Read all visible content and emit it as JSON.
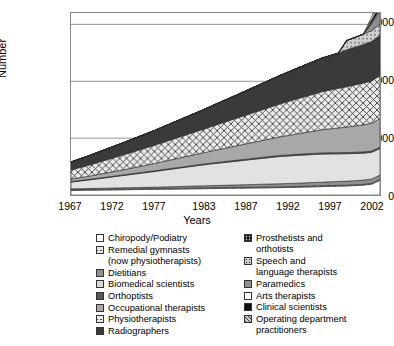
{
  "chart_data": {
    "type": "area",
    "title": "",
    "xlabel": "Years",
    "ylabel": "Number",
    "stacked": true,
    "grid": true,
    "legend_position": "bottom",
    "xlim": [
      1967,
      2004
    ],
    "ylim": [
      0,
      160000
    ],
    "yticks": [
      0,
      50000,
      100000,
      150000
    ],
    "ytick_labels": [
      "0",
      "50 000",
      "100 000",
      "150 000"
    ],
    "xticks": [
      1967,
      1972,
      1977,
      1983,
      1987,
      1992,
      1997,
      2002
    ],
    "xtick_labels": [
      "1967",
      "1972",
      "1977",
      "1983",
      "1987",
      "1992",
      "1997",
      "2002"
    ],
    "x": [
      1967,
      1968,
      1969,
      1970,
      1971,
      1972,
      1973,
      1974,
      1975,
      1976,
      1977,
      1978,
      1979,
      1980,
      1981,
      1982,
      1983,
      1984,
      1985,
      1986,
      1987,
      1988,
      1989,
      1990,
      1991,
      1992,
      1993,
      1994,
      1995,
      1996,
      1997,
      1998,
      1999,
      2000,
      2001,
      2002,
      2003,
      2004
    ],
    "series": [
      {
        "name": "Chiropody/Podiatry",
        "pattern": "white",
        "color": "#ffffff",
        "values": [
          4000,
          4100,
          4200,
          4300,
          4400,
          4500,
          4600,
          4700,
          4800,
          4900,
          5000,
          5100,
          5200,
          5300,
          5400,
          5500,
          5600,
          5700,
          5800,
          5900,
          6000,
          6100,
          6200,
          6300,
          6400,
          6500,
          6600,
          6800,
          7000,
          7200,
          7400,
          7600,
          7800,
          8000,
          8300,
          8700,
          9500,
          13000
        ]
      },
      {
        "name": "Remedial gymnasts\n(now physiotherapists)",
        "pattern": "cross-hatch",
        "color": "#e9e9e9",
        "values": [
          700,
          700,
          700,
          700,
          700,
          700,
          700,
          700,
          700,
          700,
          700,
          700,
          700,
          700,
          700,
          700,
          700,
          700,
          700,
          700,
          700,
          700,
          700,
          700,
          700,
          700,
          700,
          700,
          700,
          700,
          700,
          700,
          700,
          700,
          700,
          700,
          700,
          700
        ]
      },
      {
        "name": "Dietitians",
        "pattern": "mid-gray",
        "color": "#8f8f8f",
        "values": [
          700,
          750,
          800,
          850,
          900,
          950,
          1000,
          1050,
          1100,
          1150,
          1200,
          1300,
          1400,
          1500,
          1600,
          1700,
          1800,
          1900,
          2000,
          2100,
          2200,
          2300,
          2400,
          2500,
          2600,
          2700,
          2800,
          2900,
          3000,
          3100,
          3200,
          3300,
          3400,
          3500,
          3600,
          3700,
          3800,
          3900
        ]
      },
      {
        "name": "Biomedical scientists",
        "pattern": "light-gray",
        "color": "#e2e2e2",
        "values": [
          6000,
          6700,
          7400,
          8200,
          9000,
          9800,
          10600,
          11400,
          12200,
          13000,
          13800,
          14600,
          15400,
          16200,
          17000,
          17800,
          18500,
          19200,
          19800,
          20400,
          21000,
          21600,
          22200,
          22800,
          23400,
          24000,
          24200,
          24400,
          24500,
          24600,
          24700,
          24500,
          24300,
          24100,
          23900,
          23700,
          23500,
          23300
        ]
      },
      {
        "name": "Orthoptists",
        "pattern": "dark-gray",
        "color": "#5a5a5a",
        "values": [
          400,
          420,
          440,
          460,
          480,
          500,
          520,
          540,
          560,
          580,
          600,
          620,
          640,
          660,
          680,
          700,
          720,
          740,
          760,
          780,
          800,
          820,
          840,
          860,
          880,
          900,
          920,
          940,
          960,
          980,
          1000,
          1020,
          1040,
          1060,
          1080,
          1100,
          1120,
          1140
        ]
      },
      {
        "name": "Occupational therapists",
        "pattern": "gray",
        "color": "#a8a8a8",
        "values": [
          2200,
          2500,
          2800,
          3200,
          3600,
          4000,
          4400,
          4900,
          5400,
          5900,
          6400,
          7000,
          7600,
          8200,
          8800,
          9400,
          10000,
          10700,
          11400,
          12100,
          12800,
          13500,
          14200,
          14900,
          15600,
          16300,
          17100,
          17900,
          18700,
          19500,
          20300,
          21000,
          21700,
          22400,
          23100,
          23800,
          24500,
          25200
        ]
      },
      {
        "name": "Physiotherapists",
        "pattern": "cross-hatch",
        "color": "#e9e9e9",
        "values": [
          8000,
          8800,
          9600,
          10400,
          11200,
          12000,
          12800,
          13600,
          14400,
          15200,
          16000,
          16800,
          17600,
          18400,
          19200,
          20000,
          20800,
          21700,
          22600,
          23500,
          24400,
          25300,
          26200,
          27100,
          28000,
          28900,
          29800,
          30700,
          31600,
          32500,
          33400,
          34100,
          34800,
          35500,
          36100,
          36700,
          37200,
          37700
        ]
      },
      {
        "name": "Radiographers",
        "pattern": "very-dark",
        "color": "#3a3a3a",
        "values": [
          7000,
          7600,
          8200,
          8800,
          9400,
          10000,
          10600,
          11200,
          11800,
          12400,
          13000,
          13700,
          14400,
          15100,
          15800,
          16500,
          17300,
          18100,
          18900,
          19700,
          20500,
          21400,
          22300,
          23200,
          24100,
          25000,
          25900,
          26800,
          27700,
          28600,
          29500,
          30200,
          30900,
          31600,
          32300,
          33000,
          33700,
          34400
        ]
      },
      {
        "name": "Prosthetists and\northotists",
        "pattern": "dot-dark",
        "color": "#2e2e2e",
        "values": [
          0,
          0,
          0,
          0,
          0,
          0,
          0,
          0,
          0,
          0,
          0,
          0,
          0,
          0,
          0,
          0,
          0,
          0,
          0,
          0,
          0,
          0,
          0,
          0,
          0,
          0,
          0,
          0,
          0,
          0,
          0,
          0,
          0,
          900,
          950,
          1000,
          1050,
          1100
        ]
      },
      {
        "name": "Speech and\nlanguage therapists",
        "pattern": "dot-light",
        "color": "#cfcfcf",
        "values": [
          0,
          0,
          0,
          0,
          0,
          0,
          0,
          0,
          0,
          0,
          0,
          0,
          0,
          0,
          0,
          0,
          0,
          0,
          0,
          0,
          0,
          0,
          0,
          0,
          0,
          0,
          0,
          0,
          0,
          0,
          0,
          0,
          0,
          8000,
          8500,
          9000,
          9400,
          9800
        ]
      },
      {
        "name": "Paramedics",
        "pattern": "mid-gray",
        "color": "#7d7d7d",
        "values": [
          0,
          0,
          0,
          0,
          0,
          0,
          0,
          0,
          0,
          0,
          0,
          0,
          0,
          0,
          0,
          0,
          0,
          0,
          0,
          0,
          0,
          0,
          0,
          0,
          0,
          0,
          0,
          0,
          0,
          0,
          0,
          0,
          0,
          0,
          0,
          0,
          6000,
          11500
        ]
      },
      {
        "name": "Arts therapists",
        "pattern": "white",
        "color": "#ffffff",
        "values": [
          0,
          0,
          0,
          0,
          0,
          0,
          0,
          0,
          0,
          0,
          0,
          0,
          0,
          0,
          0,
          0,
          0,
          0,
          0,
          0,
          0,
          0,
          0,
          0,
          0,
          0,
          0,
          0,
          0,
          0,
          0,
          0,
          0,
          0,
          0,
          0,
          1200,
          1600
        ]
      },
      {
        "name": "Clinical scientists",
        "pattern": "black",
        "color": "#111111",
        "values": [
          0,
          0,
          0,
          0,
          0,
          0,
          0,
          0,
          0,
          0,
          0,
          0,
          0,
          0,
          0,
          0,
          0,
          0,
          0,
          0,
          0,
          0,
          0,
          0,
          0,
          0,
          0,
          0,
          0,
          0,
          0,
          0,
          0,
          0,
          0,
          0,
          2000,
          4200
        ]
      },
      {
        "name": "Operating department\npractitioners",
        "pattern": "diagonal-hatch",
        "color": "#c8c8c8",
        "values": [
          0,
          0,
          0,
          0,
          0,
          0,
          0,
          0,
          0,
          0,
          0,
          0,
          0,
          0,
          0,
          0,
          0,
          0,
          0,
          0,
          0,
          0,
          0,
          0,
          0,
          0,
          0,
          0,
          0,
          0,
          0,
          0,
          0,
          0,
          0,
          0,
          3000,
          7000
        ]
      }
    ]
  },
  "axes": {
    "y_title": "Number",
    "x_title": "Years",
    "y_tick_labels": [
      "150 000",
      "100 000",
      "50 000",
      "0"
    ],
    "x_tick_labels": [
      "1967",
      "1972",
      "1977",
      "1983",
      "1987",
      "1992",
      "1997",
      "2002"
    ]
  },
  "legend": {
    "left_column": [
      {
        "label": "Chiropody/Podiatry",
        "swatch": "sw-white"
      },
      {
        "label": "Remedial gymnasts\n(now physiotherapists)",
        "swatch": "sw-xhatch"
      },
      {
        "label": "Dietitians",
        "swatch": "sw-midgray"
      },
      {
        "label": "Biomedical scientists",
        "swatch": "sw-litegray"
      },
      {
        "label": "Orthoptists",
        "swatch": "sw-darkgray"
      },
      {
        "label": "Occupational therapists",
        "swatch": "sw-gray"
      },
      {
        "label": "Physiotherapists",
        "swatch": "sw-xhatch"
      },
      {
        "label": "Radiographers",
        "swatch": "sw-verydark"
      }
    ],
    "right_column": [
      {
        "label": "Prosthetists and\northotists",
        "swatch": "sw-dotdark"
      },
      {
        "label": "Speech and\nlanguage therapists",
        "swatch": "sw-dotlite"
      },
      {
        "label": "Paramedics",
        "swatch": "sw-midgray"
      },
      {
        "label": "Arts therapists",
        "swatch": "sw-white"
      },
      {
        "label": "Clinical scientists",
        "swatch": "sw-black"
      },
      {
        "label": "Operating department\npractitioners",
        "swatch": "sw-diag"
      }
    ]
  }
}
